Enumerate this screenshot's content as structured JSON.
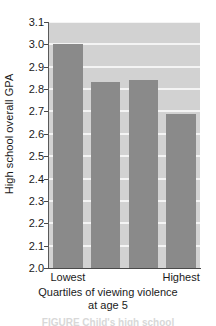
{
  "chart_data": {
    "type": "bar",
    "title": "",
    "categories": [
      "Lowest",
      "",
      "",
      "Highest"
    ],
    "values": [
      3.0,
      2.83,
      2.84,
      2.69
    ],
    "xlabel": "Quartiles of viewing violence at age 5",
    "ylabel": "High school overall GPA",
    "ylim": [
      2.0,
      3.1
    ],
    "yticks": [
      "2.0",
      "2.1",
      "2.2",
      "2.3",
      "2.4",
      "2.5",
      "2.6",
      "2.7",
      "2.8",
      "2.9",
      "3.0",
      "3.1"
    ],
    "ytick_values": [
      2.0,
      2.1,
      2.2,
      2.3,
      2.4,
      2.5,
      2.6,
      2.7,
      2.8,
      2.9,
      3.0,
      3.1
    ],
    "xtick_labels": [
      "Lowest",
      "Highest"
    ],
    "grid": true,
    "legend": false,
    "bar_color": "#8a8a8a",
    "plot_background": "#d2d2d2",
    "gridline_color": "#f4f4f4"
  },
  "axis": {
    "y_title": "High school overall GPA",
    "x_title_line1": "Quartiles of viewing violence",
    "x_title_line2": "at age 5"
  },
  "caption": {
    "fragment": "FIGURE       Child's high school"
  }
}
